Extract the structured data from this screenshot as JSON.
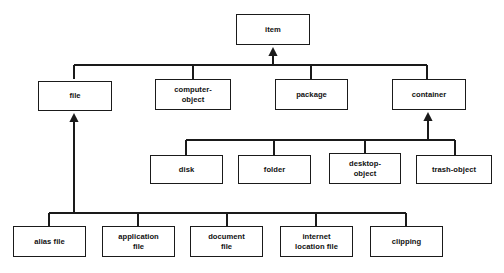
{
  "diagram": {
    "type": "class-hierarchy",
    "background_color": "#ffffff",
    "line_color": "#1a1a1a",
    "text_color": "#111111",
    "arrow_style": "solid-filled-triangle-generalization",
    "nodes": [
      {
        "id": "item",
        "label": "item",
        "x": 236,
        "y": 14,
        "w": 74,
        "h": 31,
        "row": 1
      },
      {
        "id": "file",
        "label": "file",
        "x": 38,
        "y": 81,
        "w": 74,
        "h": 30,
        "row": 2
      },
      {
        "id": "computer-object",
        "label": "computer-\nobject",
        "x": 155,
        "y": 79,
        "w": 76,
        "h": 31,
        "row": 2
      },
      {
        "id": "package",
        "label": "package",
        "x": 275,
        "y": 79,
        "w": 73,
        "h": 31,
        "row": 2
      },
      {
        "id": "container",
        "label": "container",
        "x": 392,
        "y": 79,
        "w": 74,
        "h": 31,
        "row": 2
      },
      {
        "id": "disk",
        "label": "disk",
        "x": 150,
        "y": 155,
        "w": 73,
        "h": 29,
        "row": 3
      },
      {
        "id": "folder",
        "label": "folder",
        "x": 238,
        "y": 155,
        "w": 73,
        "h": 29,
        "row": 3
      },
      {
        "id": "desktop-object",
        "label": "desktop-\nobject",
        "x": 329,
        "y": 153,
        "w": 72,
        "h": 31,
        "row": 3
      },
      {
        "id": "trash-object",
        "label": "trash-object",
        "x": 416,
        "y": 155,
        "w": 76,
        "h": 29,
        "row": 3
      },
      {
        "id": "alias-file",
        "label": "alias file",
        "x": 13,
        "y": 226,
        "w": 73,
        "h": 31,
        "row": 4
      },
      {
        "id": "application-file",
        "label": "application\nfile",
        "x": 102,
        "y": 226,
        "w": 73,
        "h": 31,
        "row": 4
      },
      {
        "id": "document-file",
        "label": "document\nfile",
        "x": 190,
        "y": 226,
        "w": 73,
        "h": 31,
        "row": 4
      },
      {
        "id": "internet-location-file",
        "label": "internet\nlocation file",
        "x": 280,
        "y": 226,
        "w": 73,
        "h": 31,
        "row": 4
      },
      {
        "id": "clipping",
        "label": "clipping",
        "x": 370,
        "y": 226,
        "w": 73,
        "h": 31,
        "row": 4
      }
    ],
    "edges": [
      {
        "from": "file",
        "to": "item",
        "kind": "generalization"
      },
      {
        "from": "computer-object",
        "to": "item",
        "kind": "generalization"
      },
      {
        "from": "package",
        "to": "item",
        "kind": "generalization"
      },
      {
        "from": "container",
        "to": "item",
        "kind": "generalization"
      },
      {
        "from": "disk",
        "to": "container",
        "kind": "generalization"
      },
      {
        "from": "folder",
        "to": "container",
        "kind": "generalization"
      },
      {
        "from": "desktop-object",
        "to": "container",
        "kind": "generalization"
      },
      {
        "from": "trash-object",
        "to": "container",
        "kind": "generalization"
      },
      {
        "from": "alias-file",
        "to": "file",
        "kind": "generalization"
      },
      {
        "from": "application-file",
        "to": "file",
        "kind": "generalization"
      },
      {
        "from": "document-file",
        "to": "file",
        "kind": "generalization"
      },
      {
        "from": "internet-location-file",
        "to": "file",
        "kind": "generalization"
      },
      {
        "from": "clipping",
        "to": "file",
        "kind": "generalization"
      }
    ],
    "buses": [
      {
        "id": "bus-item",
        "y": 65,
        "x1": 74,
        "x2": 427,
        "arrow_x": 273,
        "arrow_to_y": 47,
        "stems": [
          74,
          193,
          311,
          427
        ],
        "stem_to_y": 79
      },
      {
        "id": "bus-container",
        "y": 140,
        "x1": 186,
        "x2": 455,
        "arrow_x": 428,
        "arrow_to_y": 112,
        "stems": [
          186,
          274,
          365,
          455
        ],
        "stem_to_y": 155
      },
      {
        "id": "bus-file",
        "y": 213,
        "x1": 49,
        "x2": 406,
        "arrow_x": 74,
        "arrow_to_y": 113,
        "stems": [
          49,
          138,
          227,
          316,
          406
        ],
        "stem_to_y": 226
      }
    ]
  }
}
